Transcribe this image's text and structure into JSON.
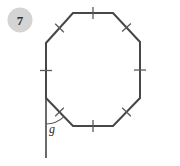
{
  "problem": {
    "number": "7"
  },
  "figure": {
    "shape_name": "regular-octagon",
    "stroke_color": "#474747",
    "tick_color": "#5a5a5a",
    "badge_fill": "#d4d4d4",
    "badge_text_color": "#2f2f2f",
    "extension_line_color": "#6a6a6a",
    "angle": {
      "label": "g",
      "type": "exterior-angle"
    },
    "vertices": [
      {
        "x": 73,
        "y": 13
      },
      {
        "x": 113,
        "y": 13
      },
      {
        "x": 140,
        "y": 42
      },
      {
        "x": 140,
        "y": 98
      },
      {
        "x": 113,
        "y": 126
      },
      {
        "x": 73,
        "y": 126
      },
      {
        "x": 46,
        "y": 98
      },
      {
        "x": 46,
        "y": 43
      }
    ],
    "side_ticks": [
      {
        "cx": 93,
        "cy": 13,
        "angle_deg": 0
      },
      {
        "cx": 126.5,
        "cy": 27.5,
        "angle_deg": 47
      },
      {
        "cx": 140,
        "cy": 70,
        "angle_deg": 90
      },
      {
        "cx": 126.5,
        "cy": 112,
        "angle_deg": 134
      },
      {
        "cx": 93,
        "cy": 126,
        "angle_deg": 0
      },
      {
        "cx": 59.5,
        "cy": 112,
        "angle_deg": 46
      },
      {
        "cx": 46,
        "cy": 70.5,
        "angle_deg": 90
      },
      {
        "cx": 59.5,
        "cy": 28,
        "angle_deg": 134
      }
    ],
    "extension_line": {
      "x1": 46,
      "y1": 98,
      "x2": 46,
      "y2": 158
    },
    "angle_arc": {
      "vertex_x": 46,
      "vertex_y": 98,
      "radius": 26,
      "label_x": 49,
      "label_y": 133
    }
  }
}
